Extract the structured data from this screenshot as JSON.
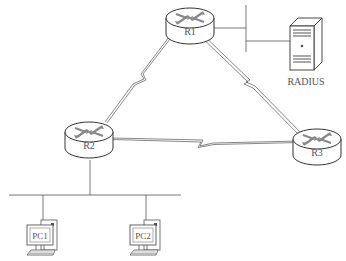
{
  "diagram": {
    "type": "network-topology",
    "routers": [
      {
        "id": "R1",
        "label": "R1",
        "x": 190,
        "y": 20
      },
      {
        "id": "R2",
        "label": "R2",
        "x": 90,
        "y": 138
      },
      {
        "id": "R3",
        "label": "R3",
        "x": 318,
        "y": 145
      }
    ],
    "server": {
      "id": "RADIUS",
      "label": "RADIUS"
    },
    "hosts": [
      {
        "id": "PC1",
        "label": "PC1"
      },
      {
        "id": "PC2",
        "label": "PC2"
      }
    ],
    "links": [
      {
        "from": "R1",
        "to": "R2",
        "type": "serial"
      },
      {
        "from": "R1",
        "to": "R3",
        "type": "serial"
      },
      {
        "from": "R2",
        "to": "R3",
        "type": "serial"
      },
      {
        "from": "R1",
        "to": "RADIUS",
        "type": "ethernet"
      },
      {
        "from": "R2",
        "to": "PC1",
        "type": "ethernet"
      },
      {
        "from": "R2",
        "to": "PC2",
        "type": "ethernet"
      }
    ],
    "colors": {
      "line": "#555555",
      "stroke": "#333333",
      "arrow": "#888888"
    }
  }
}
